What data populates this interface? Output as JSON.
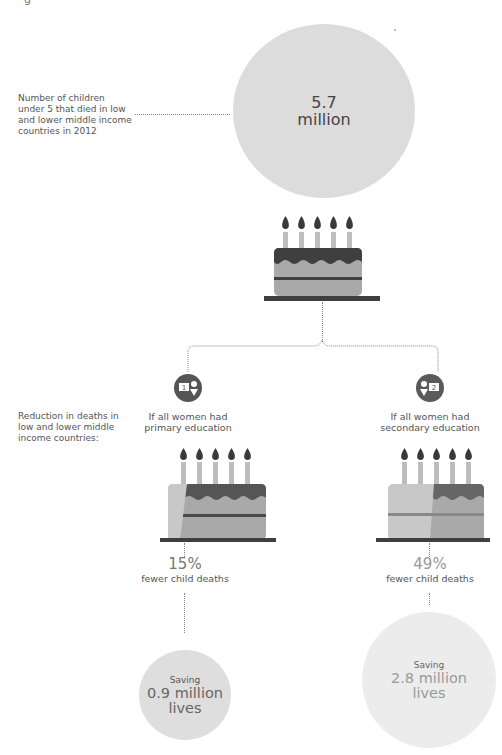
{
  "header_cutoff_text": "g",
  "intro": {
    "label": "Number of children under 5 that died in low and lower middle income countries in 2012",
    "label_lines": [
      "Number of children",
      "under 5 that died in low",
      "and lower middle income",
      "countries in 2012"
    ]
  },
  "top_circle": {
    "value": "5.7",
    "unit": "million",
    "color": "#dcdcdc"
  },
  "reduction_label_lines": [
    "Reduction in deaths in",
    "low and lower middle",
    "income countries:"
  ],
  "scenarios": [
    {
      "badge": "1",
      "caption_lines": [
        "If all women had",
        "primary education"
      ],
      "percent": "15%",
      "effect": "fewer child deaths",
      "saving_label": "Saving",
      "saving_value": "0.9 million",
      "saving_unit": "lives",
      "circle_color": "#dedede"
    },
    {
      "badge": "2",
      "caption_lines": [
        "If all women had",
        "secondary education"
      ],
      "percent": "49%",
      "effect": "fewer child deaths",
      "saving_label": "Saving",
      "saving_value": "2.8 million",
      "saving_unit": "lives",
      "circle_color": "#ececec"
    }
  ],
  "colors": {
    "cake_dark": "#3f3f3f",
    "cake_light": "#a9a9a9",
    "cake_fade": "#c8c8c8",
    "candle": "#bdbdbd",
    "flame": "#3a3a3a",
    "line": "#888888"
  }
}
